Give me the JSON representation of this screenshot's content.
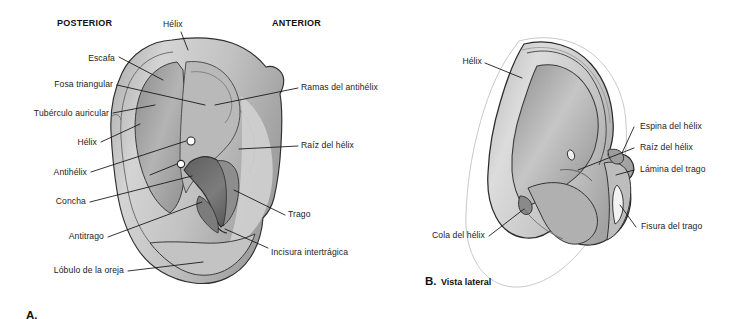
{
  "figure": {
    "kind": "anatomical-illustration",
    "language": "es",
    "colors": {
      "ink": "#1c1c1c",
      "leader_line": "#101010",
      "outline": "#2b2b2b",
      "skin_light": "#e9e9e9",
      "skin_mid": "#c9c9c9",
      "skin_dark": "#9d9d9d",
      "cavity_dark": "#6e6e6e",
      "cavity_darkest": "#5a5a5a",
      "ghost_outline": "#c9c9c9",
      "page_background": "#ffffff"
    }
  },
  "panel_a": {
    "caption_letter": "A.",
    "caption_text": "",
    "orientation_left": "POSTERIOR",
    "orientation_right": "ANTERIOR",
    "labels_top": [
      {
        "text": "Hélix"
      }
    ],
    "labels_left": [
      {
        "text": "Escafa"
      },
      {
        "text": "Fosa triangular"
      },
      {
        "text": "Tubérculo auricular"
      },
      {
        "text": "Hélix"
      },
      {
        "text": "Antihélix"
      },
      {
        "text": "Concha"
      },
      {
        "text": "Antitrago"
      },
      {
        "text": "Lóbulo de la oreja"
      }
    ],
    "labels_right": [
      {
        "text": "Ramas del antihélix"
      },
      {
        "text": "Raíz del hélix"
      },
      {
        "text": "Trago"
      },
      {
        "text": "Incisura intertrágica"
      }
    ]
  },
  "panel_b": {
    "caption_letter": "B.",
    "caption_text": "Vista lateral",
    "labels_left": [
      {
        "text": "Hélix"
      },
      {
        "text": "Cola del hélix"
      }
    ],
    "labels_right": [
      {
        "text": "Espina del hélix"
      },
      {
        "text": "Raíz del hélix"
      },
      {
        "text": "Lámina del trago"
      },
      {
        "text": "Fisura del trago"
      }
    ]
  }
}
